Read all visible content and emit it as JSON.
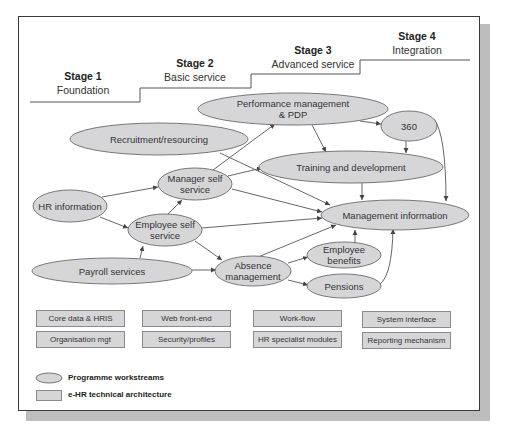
{
  "stages": [
    {
      "num": "Stage 1",
      "desc": "Foundation"
    },
    {
      "num": "Stage 2",
      "desc": "Basic service"
    },
    {
      "num": "Stage 3",
      "desc": "Advanced service"
    },
    {
      "num": "Stage 4",
      "desc": "Integration"
    }
  ],
  "workstreams": {
    "performance": "Performance management & PDP",
    "performance_l1": "Performance management",
    "performance_l2": "& PDP",
    "three60": "360",
    "recruitment": "Recruitment/resourcing",
    "manager_l1": "Manager self",
    "manager_l2": "service",
    "training": "Training and development",
    "hr_info": "HR information",
    "employee_l1": "Employee self",
    "employee_l2": "service",
    "mgmt_info": "Management information",
    "payroll": "Payroll services",
    "absence_l1": "Absence",
    "absence_l2": "management",
    "benefits_l1": "Employee",
    "benefits_l2": "benefits",
    "pensions": "Pensions"
  },
  "architecture": [
    [
      "Core data & HRIS",
      "Web front-end",
      "Work-flow",
      "System interface"
    ],
    [
      "Organisation mgt",
      "Security/profiles",
      "HR specialist modules",
      "Reporting mechanism"
    ]
  ],
  "legend": {
    "workstreams": "Programme workstreams",
    "architecture": "e-HR technical architecture"
  },
  "colors": {
    "node_fill": "#d6d6d9",
    "node_stroke": "#6a6a6a",
    "edge": "#555555",
    "frame": "#3a3a3a",
    "shadow": "#bdbdbd"
  }
}
